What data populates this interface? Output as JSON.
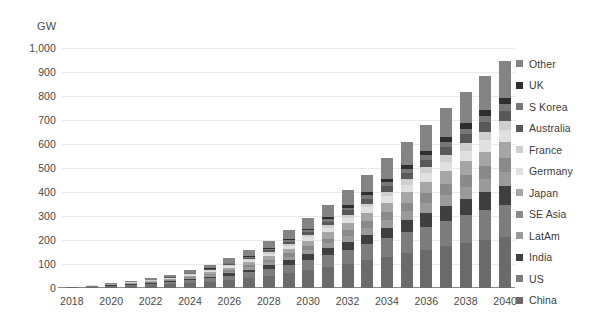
{
  "chart_data": {
    "type": "bar",
    "stacked": true,
    "title": "",
    "subtitle": "",
    "xlabel": "",
    "ylabel": "GW",
    "unit_label": "GW",
    "ylim": [
      0,
      1000
    ],
    "ytick_values": [
      0,
      100,
      200,
      300,
      400,
      500,
      600,
      700,
      800,
      900,
      1000
    ],
    "ytick_labels": [
      "0",
      "100",
      "200",
      "300",
      "400",
      "500",
      "600",
      "700",
      "800",
      "900",
      "1,000"
    ],
    "grid": true,
    "legend_position": "right",
    "x": [
      2018,
      2019,
      2020,
      2021,
      2022,
      2023,
      2024,
      2025,
      2026,
      2027,
      2028,
      2029,
      2030,
      2031,
      2032,
      2033,
      2034,
      2035,
      2036,
      2037,
      2038,
      2039,
      2040
    ],
    "categories": [
      "2018",
      "2019",
      "2020",
      "2021",
      "2022",
      "2023",
      "2024",
      "2025",
      "2026",
      "2027",
      "2028",
      "2029",
      "2030",
      "2031",
      "2032",
      "2033",
      "2034",
      "2035",
      "2036",
      "2037",
      "2038",
      "2039",
      "2040"
    ],
    "xtick_labels": [
      "2018",
      "2020",
      "2022",
      "2024",
      "2026",
      "2028",
      "2030",
      "2032",
      "2034",
      "2036",
      "2038",
      "2040"
    ],
    "xtick_positions": [
      2018,
      2020,
      2022,
      2024,
      2026,
      2028,
      2030,
      2032,
      2034,
      2036,
      2038,
      2040
    ],
    "stack_order_bottom_to_top": [
      "China",
      "US",
      "India",
      "LatAm",
      "SE Asia",
      "Japan",
      "Germany",
      "France",
      "Australia",
      "S Korea",
      "UK",
      "Other"
    ],
    "series": [
      {
        "name": "China",
        "color": "#6b6b6b",
        "values": [
          3,
          5,
          7,
          9,
          12,
          16,
          21,
          27,
          34,
          42,
          52,
          63,
          75,
          88,
          102,
          116,
          131,
          146,
          160,
          174,
          188,
          200,
          212
        ]
      },
      {
        "name": "US",
        "color": "#7d7d7d",
        "values": [
          1,
          2,
          3,
          4,
          6,
          8,
          11,
          14,
          18,
          23,
          29,
          35,
          42,
          50,
          58,
          67,
          76,
          86,
          96,
          106,
          116,
          126,
          136
        ]
      },
      {
        "name": "India",
        "color": "#3f3f3f",
        "values": [
          0,
          1,
          1,
          2,
          3,
          4,
          5,
          7,
          9,
          12,
          15,
          19,
          23,
          28,
          33,
          39,
          45,
          51,
          57,
          63,
          69,
          74,
          79
        ]
      },
      {
        "name": "LatAm",
        "color": "#9a9a9a",
        "values": [
          0,
          1,
          1,
          2,
          2,
          3,
          4,
          5,
          7,
          9,
          11,
          14,
          17,
          20,
          24,
          28,
          32,
          36,
          41,
          45,
          49,
          53,
          57
        ]
      },
      {
        "name": "SE Asia",
        "color": "#8a8a8a",
        "values": [
          0,
          0,
          1,
          1,
          2,
          3,
          4,
          5,
          7,
          9,
          11,
          14,
          17,
          20,
          24,
          28,
          32,
          37,
          41,
          46,
          50,
          54,
          58
        ]
      },
      {
        "name": "Japan",
        "color": "#a5a5a5",
        "values": [
          1,
          1,
          2,
          3,
          4,
          5,
          6,
          8,
          10,
          12,
          15,
          18,
          22,
          26,
          30,
          34,
          39,
          43,
          48,
          52,
          57,
          61,
          65
        ]
      },
      {
        "name": "Germany",
        "color": "#e0e0e0",
        "values": [
          0,
          1,
          1,
          2,
          2,
          3,
          4,
          5,
          6,
          8,
          10,
          12,
          15,
          18,
          21,
          24,
          28,
          32,
          36,
          40,
          44,
          48,
          52
        ]
      },
      {
        "name": "France",
        "color": "#cfcfcf",
        "values": [
          0,
          0,
          1,
          1,
          1,
          2,
          2,
          3,
          4,
          5,
          6,
          8,
          10,
          12,
          14,
          16,
          19,
          22,
          25,
          28,
          31,
          34,
          37
        ]
      },
      {
        "name": "Australia",
        "color": "#595959",
        "values": [
          0,
          0,
          1,
          1,
          1,
          2,
          3,
          4,
          5,
          6,
          8,
          10,
          12,
          15,
          18,
          21,
          24,
          27,
          30,
          34,
          37,
          40,
          43
        ]
      },
      {
        "name": "S Korea",
        "color": "#777777",
        "values": [
          0,
          0,
          0,
          1,
          1,
          1,
          2,
          2,
          3,
          4,
          5,
          6,
          8,
          9,
          11,
          13,
          15,
          17,
          19,
          21,
          23,
          25,
          27
        ]
      },
      {
        "name": "UK",
        "color": "#2e2e2e",
        "values": [
          0,
          0,
          0,
          1,
          1,
          1,
          2,
          2,
          3,
          4,
          5,
          6,
          7,
          9,
          11,
          13,
          15,
          17,
          19,
          21,
          23,
          25,
          27
        ]
      },
      {
        "name": "Other",
        "color": "#848484",
        "values": [
          1,
          2,
          3,
          4,
          6,
          8,
          11,
          14,
          18,
          23,
          29,
          36,
          44,
          53,
          63,
          73,
          84,
          96,
          108,
          120,
          132,
          143,
          153
        ]
      }
    ],
    "totals": [
      6,
      13,
      21,
      31,
      41,
      56,
      75,
      96,
      124,
      157,
      196,
      241,
      292,
      348,
      409,
      472,
      540,
      610,
      680,
      750,
      819,
      883,
      946
    ]
  },
  "legend": {
    "items": [
      {
        "label": "Other",
        "color": "#848484"
      },
      {
        "label": "UK",
        "color": "#2e2e2e"
      },
      {
        "label": "S Korea",
        "color": "#777777"
      },
      {
        "label": "Australia",
        "color": "#595959"
      },
      {
        "label": "France",
        "color": "#cfcfcf"
      },
      {
        "label": "Germany",
        "color": "#e0e0e0"
      },
      {
        "label": "Japan",
        "color": "#a5a5a5"
      },
      {
        "label": "SE Asia",
        "color": "#8a8a8a"
      },
      {
        "label": "LatAm",
        "color": "#9a9a9a"
      },
      {
        "label": "India",
        "color": "#3f3f3f"
      },
      {
        "label": "US",
        "color": "#7d7d7d"
      },
      {
        "label": "China",
        "color": "#6b6b6b"
      }
    ]
  },
  "style": {
    "background": "#ffffff",
    "grid_color": "#e9e9e9",
    "axis_color": "#8a8a8a",
    "text_color": "#3b3b3b"
  }
}
